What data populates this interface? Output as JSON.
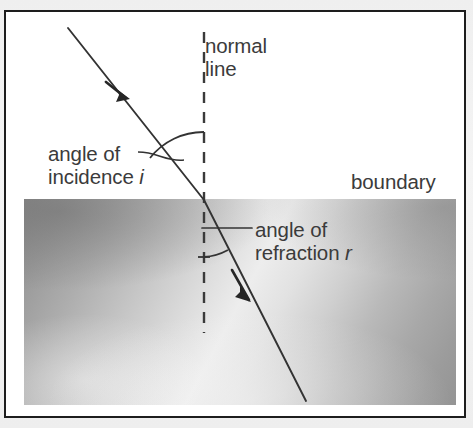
{
  "figure": {
    "kind": "physics-diagram",
    "topic": "refraction-of-light-at-a-boundary",
    "labels": {
      "normal_line_l1": "normal",
      "normal_line_l2": "line",
      "angle_of_incidence_l1": "angle of",
      "angle_of_incidence_l2_text": "incidence",
      "angle_of_incidence_symbol": "i",
      "angle_of_refraction_l1": "angle of",
      "angle_of_refraction_l2_text": "refraction",
      "angle_of_refraction_symbol": "r",
      "boundary": "boundary"
    },
    "colors": {
      "frame_border": "#1d1d1d",
      "upper_medium_fill": "#ffffff",
      "lower_medium_fill": "#b4b4b4",
      "ray_stroke": "#333333",
      "normal_stroke": "#3a3a3a",
      "text": "#3b3b3b",
      "page_background": "#f2f2f2"
    },
    "geometry": {
      "incident_ray_start": [
        62,
        16
      ],
      "incidence_point": [
        198,
        188
      ],
      "refracted_ray_end": [
        300,
        389
      ],
      "normal_top": [
        198,
        20
      ],
      "normal_bottom": [
        198,
        321
      ],
      "boundary_y": 187
    }
  }
}
